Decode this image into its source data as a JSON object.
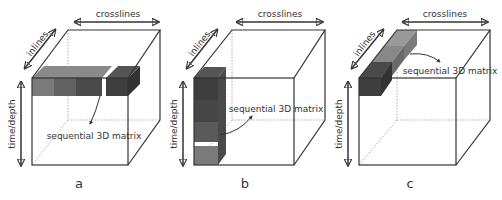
{
  "figure": {
    "panels": [
      {
        "id": "a",
        "label": "a",
        "axis_crosslines": "crosslines",
        "axis_inlines": "inlines",
        "axis_time": "time/depth",
        "annotation": "sequential 3D matrix"
      },
      {
        "id": "b",
        "label": "b",
        "axis_crosslines": "crosslines",
        "axis_inlines": "inlines",
        "axis_time": "time/depth",
        "annotation": "sequential 3D matrix"
      },
      {
        "id": "c",
        "label": "c",
        "axis_crosslines": "crosslines",
        "axis_inlines": "inlines",
        "axis_time": "time/depth",
        "annotation": "sequential 3D matrix"
      }
    ],
    "colors": {
      "edge": "#333333",
      "block_light": "#7a7a7a",
      "block_mid": "#5c5c5c",
      "block_dark": "#3e3e3e"
    }
  }
}
